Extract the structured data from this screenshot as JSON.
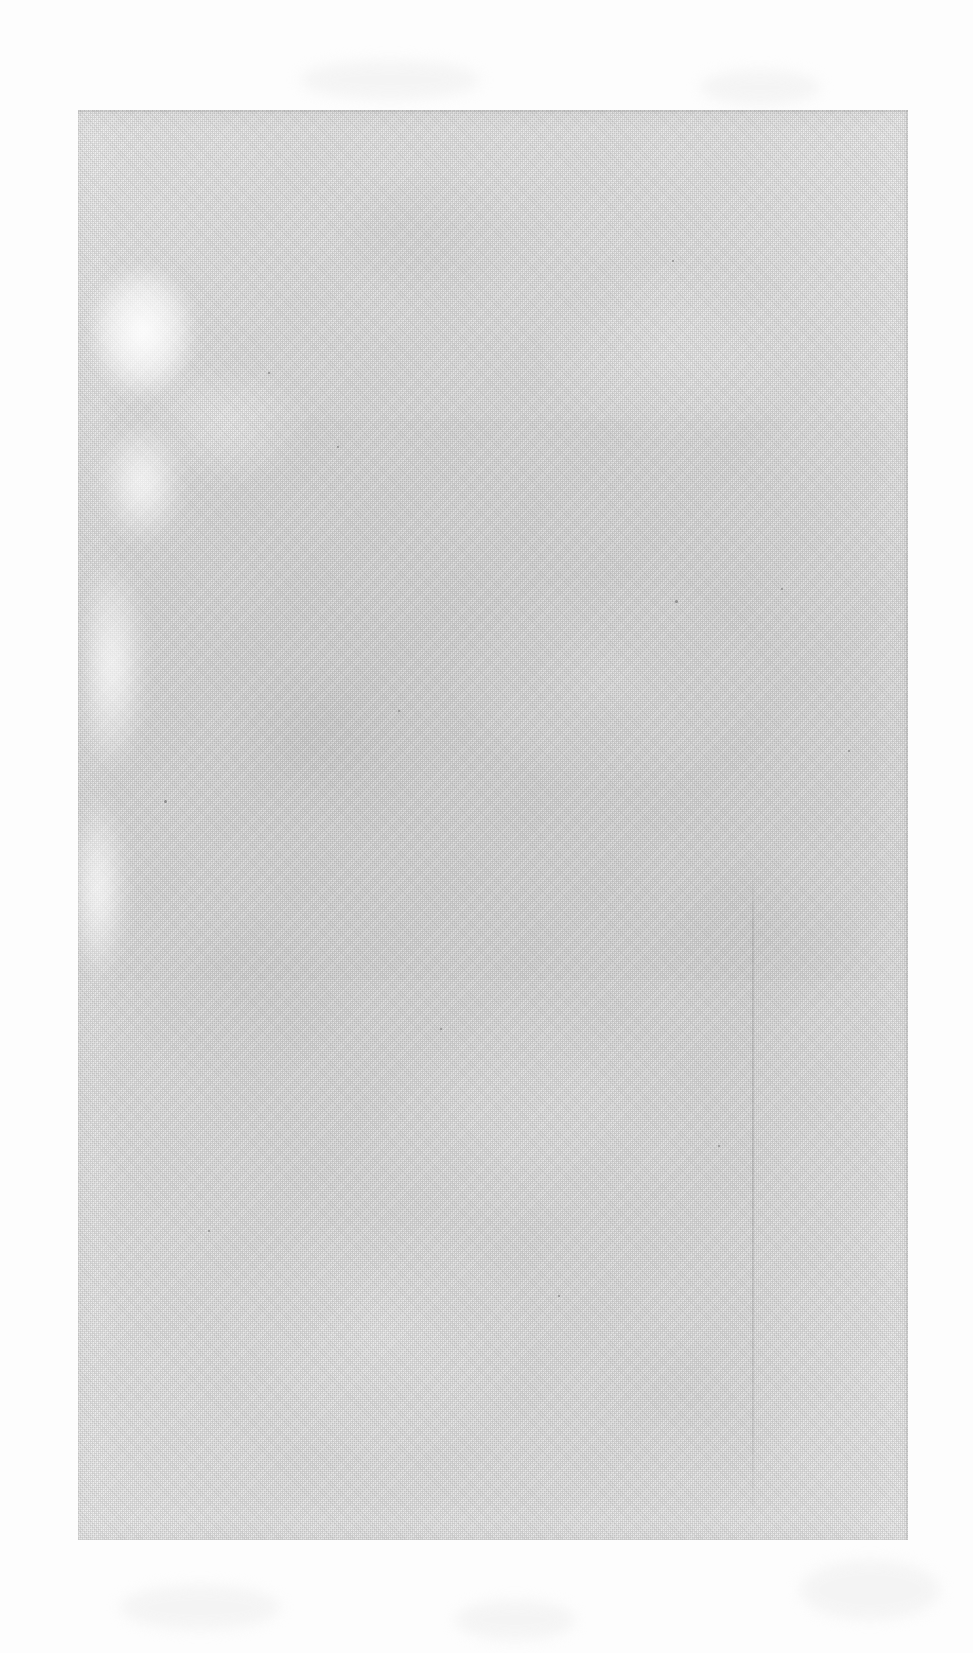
{
  "document": {
    "kind": "scanned-page",
    "content_state": "blank",
    "visible_text": "",
    "caption": ""
  },
  "canvas": {
    "width": 973,
    "height": 1653,
    "background_color": "#fdfdfd"
  },
  "page": {
    "left": 78,
    "top": 110,
    "width": 830,
    "height": 1430,
    "paper_color": "#e3e3e3",
    "edge_color": "#d4d4d4",
    "texture": "halftone-grain"
  },
  "artifacts": {
    "bleach_streaks": [
      {
        "name": "upper-left-bleach",
        "left": 10,
        "top": 150,
        "width": 130,
        "height": 180
      },
      {
        "name": "upper-left-bleach-tail",
        "left": 6,
        "top": 300,
        "width": 110,
        "height": 150
      },
      {
        "name": "left-margin-light",
        "left": 0,
        "top": 420,
        "width": 80,
        "height": 260
      }
    ],
    "tone_bands": [
      {
        "name": "upper-band",
        "top": 0,
        "height": 310,
        "tint": "rgba(0,0,0,0.012)"
      },
      {
        "name": "mid-band",
        "top": 310,
        "height": 560,
        "tint": "rgba(0,0,0,0.020)"
      },
      {
        "name": "lower-band",
        "top": 870,
        "height": 560,
        "tint": "rgba(0,0,0,0.014)"
      }
    ],
    "crease": {
      "name": "vertical-crease",
      "left": 674,
      "top": 760,
      "height": 660
    },
    "specks": [
      {
        "left": 597,
        "top": 490,
        "size": 3
      },
      {
        "left": 259,
        "top": 336,
        "size": 2
      },
      {
        "left": 594,
        "top": 150,
        "size": 2
      },
      {
        "left": 86,
        "top": 690,
        "size": 3
      },
      {
        "left": 362,
        "top": 918,
        "size": 2
      },
      {
        "left": 703,
        "top": 478,
        "size": 2
      },
      {
        "left": 190,
        "top": 262,
        "size": 2
      },
      {
        "left": 480,
        "top": 1185,
        "size": 2
      },
      {
        "left": 640,
        "top": 1035,
        "size": 2
      },
      {
        "left": 130,
        "top": 1120,
        "size": 2
      },
      {
        "left": 770,
        "top": 640,
        "size": 2
      },
      {
        "left": 320,
        "top": 600,
        "size": 2
      }
    ],
    "bed_ghosts": [
      {
        "left": 800,
        "top": 1560,
        "width": 140,
        "height": 60
      },
      {
        "left": 120,
        "top": 1585,
        "width": 160,
        "height": 45
      },
      {
        "left": 455,
        "top": 1600,
        "width": 120,
        "height": 40
      },
      {
        "left": 300,
        "top": 60,
        "width": 180,
        "height": 40
      },
      {
        "left": 700,
        "top": 70,
        "width": 120,
        "height": 35
      }
    ]
  }
}
